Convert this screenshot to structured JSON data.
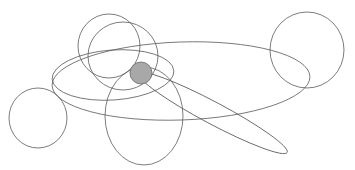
{
  "canvas": {
    "width": 355,
    "height": 170,
    "background": "#ffffff",
    "title": ""
  },
  "style": {
    "stroke_color": "#5a5a5a",
    "stroke_width": 0.8,
    "fill_none": "none",
    "highlight_fill": "#a8a8a8",
    "highlight_stroke": "#6b6b6b"
  },
  "chart_data": {
    "type": "scatter",
    "title": "",
    "xlabel": "",
    "ylabel": "",
    "xlim": [
      0,
      355
    ],
    "ylim": [
      0,
      170
    ],
    "grid": false,
    "legend": "none",
    "shape_count": 9,
    "filled_shape_count": 1,
    "shapes": [
      {
        "id": "ellipse-bottom-left-circle",
        "label": "bottom-left circle",
        "cx": 38,
        "cy": 118,
        "rx": 29,
        "ry": 30,
        "rotation": 0,
        "filled": false
      },
      {
        "id": "ellipse-top-right-circle",
        "label": "top-right circle",
        "cx": 307,
        "cy": 50,
        "rx": 37,
        "ry": 38,
        "rotation": 0,
        "filled": false
      },
      {
        "id": "ellipse-upper-left-large-circle",
        "label": "upper-left large circle",
        "cx": 109,
        "cy": 46,
        "rx": 31,
        "ry": 32,
        "rotation": 0,
        "filled": false
      },
      {
        "id": "ellipse-upper-mid-circle",
        "label": "upper-middle circle",
        "cx": 123,
        "cy": 56,
        "rx": 35,
        "ry": 34,
        "rotation": 0,
        "filled": false
      },
      {
        "id": "ellipse-bottom-center-oval",
        "label": "bottom-center vertical oval",
        "cx": 144,
        "cy": 116,
        "rx": 39,
        "ry": 49,
        "rotation": 0,
        "filled": false
      },
      {
        "id": "ellipse-mid-left-wide",
        "label": "mid-left wide ellipse",
        "cx": 113,
        "cy": 75,
        "rx": 61,
        "ry": 25,
        "rotation": -4,
        "filled": false
      },
      {
        "id": "ellipse-large-wide-right",
        "label": "large wide right ellipse",
        "cx": 181,
        "cy": 81,
        "rx": 129,
        "ry": 39,
        "rotation": -2,
        "filled": false
      },
      {
        "id": "ellipse-thin-diagonal",
        "label": "thin diagonal ellipse",
        "cx": 213,
        "cy": 113,
        "rx": 84,
        "ry": 11,
        "rotation": 28,
        "filled": false
      },
      {
        "id": "ellipse-center-filled",
        "label": "center filled gray ellipse",
        "cx": 141,
        "cy": 73,
        "rx": 11,
        "ry": 11,
        "rotation": 0,
        "filled": true
      }
    ]
  }
}
